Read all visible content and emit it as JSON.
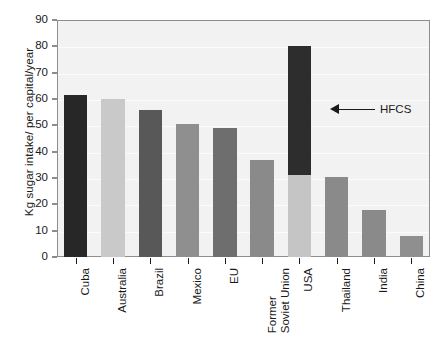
{
  "chart_data": {
    "type": "bar",
    "title": "",
    "xlabel": "",
    "ylabel": "Kg sugar intake/ per capital/year",
    "ylim": [
      0,
      90
    ],
    "ytick_step": 10,
    "yticks": [
      "0",
      "10",
      "20",
      "30",
      "40",
      "50",
      "60",
      "70",
      "80",
      "90"
    ],
    "grid": true,
    "legend": "none",
    "stacked": true,
    "categories": [
      "Cuba",
      "Australia",
      "Brazil",
      "Mexico",
      "EU",
      "Former\nSoviet Union",
      "USA",
      "Thailand",
      "India",
      "China"
    ],
    "values": [
      61.5,
      60,
      56,
      50.5,
      49,
      37,
      80,
      30.5,
      18,
      8
    ],
    "series": [
      {
        "name": "Sugar",
        "values": [
          61.5,
          60,
          56,
          50.5,
          49,
          37,
          31,
          30.5,
          18,
          8
        ]
      },
      {
        "name": "HFCS",
        "values": [
          0,
          0,
          0,
          0,
          0,
          0,
          49,
          0,
          0,
          0
        ]
      }
    ],
    "bar_colors": [
      "#272727",
      "#c9c9c9",
      "#585858",
      "#8f8f8f",
      "#6e6e6e",
      "#8a8a8a",
      "#c5c5c5",
      "#8a8a8a",
      "#8a8a8a",
      "#8f8f8f"
    ],
    "hfcs_color": "#2d2d2d",
    "plot_background": "#f2f2f2",
    "annotations": [
      {
        "text": "HFCS",
        "points_to": "usa-hfcs-segment",
        "arrow_direction": "left",
        "value_level": 55
      }
    ]
  }
}
